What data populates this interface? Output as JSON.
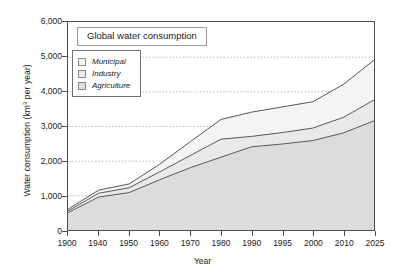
{
  "chart_data": {
    "type": "area",
    "stacked": true,
    "title": "Global water consumption",
    "xlabel": "Year",
    "ylabel_prefix": "Water consumption (km",
    "ylabel_sup": "3",
    "ylabel_suffix": " per year)",
    "ylabel_full": "Water consumption (km3 per year)",
    "categories": [
      "1900",
      "1940",
      "1950",
      "1960",
      "1970",
      "1980",
      "1990",
      "1995",
      "2000",
      "2010",
      "2025"
    ],
    "ylim": [
      0,
      6000
    ],
    "yticks": [
      "6,000",
      "5,000",
      "4,000",
      "3,000",
      "2,000",
      "1,000",
      "0"
    ],
    "ytick_values": [
      6000,
      5000,
      4000,
      3000,
      2000,
      1000,
      0
    ],
    "grid": "horizontal-dotted",
    "legend_position": "upper-left-inside",
    "series": [
      {
        "name": "Agriculture",
        "color": "#dcdcdc",
        "values": [
          500,
          950,
          1080,
          1450,
          1800,
          2100,
          2400,
          2480,
          2580,
          2800,
          3150
        ]
      },
      {
        "name": "Industry",
        "color": "#e9e9e9",
        "values": [
          50,
          110,
          140,
          230,
          350,
          520,
          300,
          330,
          360,
          450,
          600
        ]
      },
      {
        "name": "Municipal",
        "color": "#f4f4f4",
        "values": [
          50,
          90,
          110,
          220,
          400,
          570,
          700,
          740,
          760,
          950,
          1150
        ]
      }
    ],
    "cumulative_totals": {
      "agriculture_top": [
        500,
        950,
        1080,
        1450,
        1800,
        2100,
        2400,
        2480,
        2580,
        2800,
        3150
      ],
      "industry_top": [
        550,
        1060,
        1220,
        1680,
        2150,
        2620,
        2700,
        2810,
        2940,
        3250,
        3750
      ],
      "municipal_top": [
        600,
        1150,
        1330,
        1900,
        2550,
        3190,
        3400,
        3550,
        3700,
        4200,
        4900
      ]
    },
    "line_color": "#555555",
    "axis_color": "#4d4d4d"
  },
  "legend": {
    "items": [
      {
        "label": "Municipal",
        "swatch_color": "#f7f7f7"
      },
      {
        "label": "Industry",
        "swatch_color": "#ebebeb"
      },
      {
        "label": "Agriculture",
        "swatch_color": "#dedede"
      }
    ]
  }
}
